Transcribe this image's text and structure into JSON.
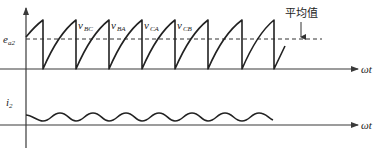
{
  "diagram": {
    "type": "waveform",
    "top_plot": {
      "y_label": {
        "main": "e",
        "sub": "a2"
      },
      "x_label": "ωt",
      "average_label": "平均值",
      "phase_labels": [
        {
          "main": "v",
          "sub": "BC"
        },
        {
          "main": "v",
          "sub": "BA"
        },
        {
          "main": "v",
          "sub": "CA"
        },
        {
          "main": "v",
          "sub": "CB"
        }
      ]
    },
    "bottom_plot": {
      "y_label": {
        "main": "i",
        "sub": "2"
      },
      "x_label": "ωt"
    },
    "colors": {
      "stroke": "#222222",
      "axis": "#3a3a3a",
      "background": "#ffffff"
    }
  }
}
